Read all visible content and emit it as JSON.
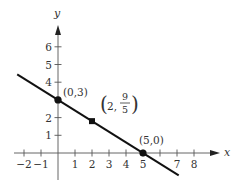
{
  "figure": {
    "type": "coordinate-plane-line",
    "x_axis_label": "x",
    "y_axis_label": "y",
    "x_ticks": [
      -2,
      -1,
      1,
      2,
      3,
      4,
      5,
      7,
      8
    ],
    "x_tick_marks": [
      -2,
      -1,
      1,
      2,
      3,
      4,
      5,
      6,
      7,
      8
    ],
    "y_ticks": [
      1,
      2,
      4,
      5,
      6
    ],
    "y_tick_marks": [
      1,
      2,
      3,
      4,
      5,
      6
    ],
    "x_tick_labels": [
      "−2",
      "−1",
      "1",
      "2",
      "3",
      "4",
      "5",
      "7",
      "8"
    ],
    "y_tick_labels": [
      "1",
      "2",
      "4",
      "5",
      "6"
    ],
    "line": {
      "slope": -0.6,
      "intercept": 3,
      "x_from": -2.4,
      "x_to": 7.1,
      "color": "#111111"
    },
    "points": [
      {
        "x": 0,
        "y": 3,
        "label": "(0,3)"
      },
      {
        "x": 2,
        "y": 1.8,
        "label_prefix": "2,",
        "label_num": "9",
        "label_den": "5"
      },
      {
        "x": 5,
        "y": 0,
        "label": "(5,0)"
      }
    ],
    "colors": {
      "axis": "#555555",
      "line": "#111111",
      "point": "#111111",
      "text": "#333333"
    }
  }
}
